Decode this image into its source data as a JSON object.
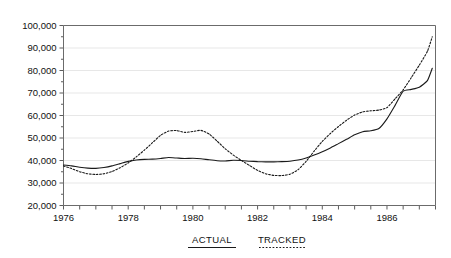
{
  "chart_data": {
    "type": "line",
    "title": "",
    "subtitle": "",
    "xlabel": "",
    "ylabel": "",
    "grid": "horizontal",
    "legend_position": "bottom",
    "xlim": [
      1976.0,
      1987.5
    ],
    "ylim": [
      20000,
      100000
    ],
    "y_ticks": [
      20000,
      30000,
      40000,
      50000,
      60000,
      70000,
      80000,
      90000,
      100000
    ],
    "y_tick_labels": [
      "20,000",
      "30,000",
      "40,000",
      "50,000",
      "60,000",
      "70,000",
      "80,000",
      "90,000",
      "100,000"
    ],
    "x_ticks": [
      1976,
      1978,
      1980,
      1982,
      1984,
      1986
    ],
    "x_tick_labels": [
      "1976",
      "1978",
      "1980",
      "1982",
      "1984",
      "1986"
    ],
    "x_minor_tick_interval": 0.5,
    "x": [
      1976.0,
      1976.25,
      1976.5,
      1976.75,
      1977.0,
      1977.25,
      1977.5,
      1977.75,
      1978.0,
      1978.25,
      1978.5,
      1978.75,
      1979.0,
      1979.25,
      1979.5,
      1979.75,
      1980.0,
      1980.25,
      1980.5,
      1980.75,
      1981.0,
      1981.25,
      1981.5,
      1981.75,
      1982.0,
      1982.25,
      1982.5,
      1982.75,
      1983.0,
      1983.25,
      1983.5,
      1983.75,
      1984.0,
      1984.25,
      1984.5,
      1984.75,
      1985.0,
      1985.25,
      1985.5,
      1985.75,
      1986.0,
      1986.25,
      1986.5,
      1986.75,
      1987.0,
      1987.25,
      1987.4
    ],
    "series": [
      {
        "name": "ACTUAL",
        "style": "solid",
        "color": "#1a1a1a",
        "values": [
          38000,
          37600,
          37000,
          36600,
          36500,
          36900,
          37600,
          38600,
          39600,
          40200,
          40500,
          40600,
          40900,
          41300,
          41100,
          40900,
          41000,
          40800,
          40300,
          39900,
          39800,
          40100,
          40000,
          39700,
          39500,
          39400,
          39400,
          39500,
          39700,
          40200,
          41100,
          42400,
          43900,
          45600,
          47500,
          49400,
          51400,
          52800,
          53200,
          54200,
          58500,
          64500,
          70800,
          71600,
          72600,
          75500,
          81000
        ]
      },
      {
        "name": "TRACKED",
        "style": "dashed",
        "color": "#1a1a1a",
        "values": [
          37600,
          36400,
          35000,
          34100,
          33800,
          34100,
          35100,
          36800,
          38900,
          41600,
          44600,
          47900,
          51200,
          53100,
          53300,
          52500,
          52900,
          53400,
          51800,
          48600,
          45200,
          42400,
          40000,
          37800,
          35600,
          34100,
          33400,
          33300,
          33900,
          35900,
          39600,
          44200,
          48500,
          52000,
          55100,
          57900,
          60200,
          61600,
          62100,
          62400,
          63500,
          67400,
          71400,
          76800,
          82400,
          88500,
          95000
        ]
      }
    ]
  },
  "legend": {
    "items": [
      {
        "label": "ACTUAL",
        "style": "solid"
      },
      {
        "label": "TRACKED",
        "style": "dashed"
      }
    ]
  }
}
